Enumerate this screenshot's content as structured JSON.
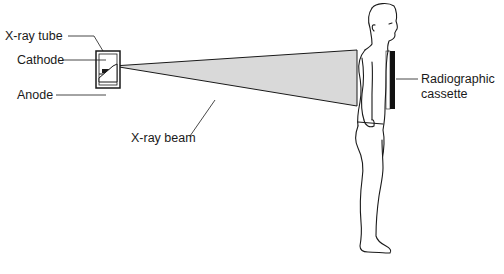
{
  "diagram": {
    "labels": {
      "xray_tube": "X-ray tube",
      "cathode": "Cathode",
      "anode": "Anode",
      "xray_beam": "X-ray beam",
      "cassette_line1": "Radiographic",
      "cassette_line2": "cassette"
    },
    "colors": {
      "line": "#1a1a1a",
      "beam_fill": "#d9d9d9",
      "cassette": "#111111",
      "background": "#ffffff"
    }
  }
}
